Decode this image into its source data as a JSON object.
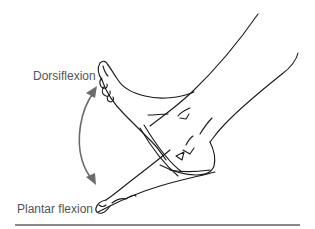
{
  "figure": {
    "labels": {
      "dorsiflexion": "Dorsiflexion",
      "plantar_flexion": "Plantar flexion"
    },
    "arrow": {
      "type": "double-headed curved arrow",
      "color": "#6b6b6b"
    },
    "line_color": "#1a1a1a",
    "rule_color": "#8a8a8a"
  }
}
